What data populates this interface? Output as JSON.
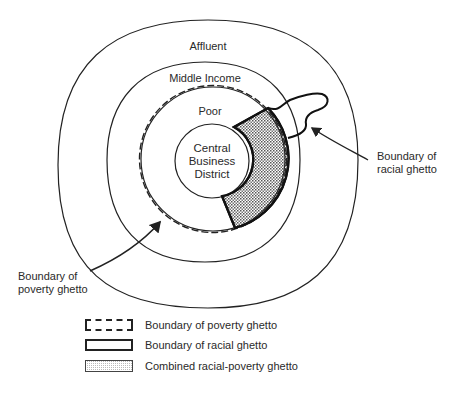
{
  "diagram": {
    "zones": {
      "affluent": "Affluent",
      "middle_income": "Middle Income",
      "poor": "Poor",
      "cbd_line1": "Central",
      "cbd_line2": "Business",
      "cbd_line3": "District"
    },
    "callouts": {
      "racial_line1": "Boundary of",
      "racial_line2": "racial ghetto",
      "poverty_line1": "Boundary of",
      "poverty_line2": "poverty ghetto"
    }
  },
  "legend": {
    "items": [
      {
        "label": "Boundary of poverty ghetto",
        "style": "dashed-outline"
      },
      {
        "label": "Boundary of racial ghetto",
        "style": "solid-outline"
      },
      {
        "label": "Combined racial-poverty ghetto",
        "style": "stippled-fill"
      }
    ]
  }
}
